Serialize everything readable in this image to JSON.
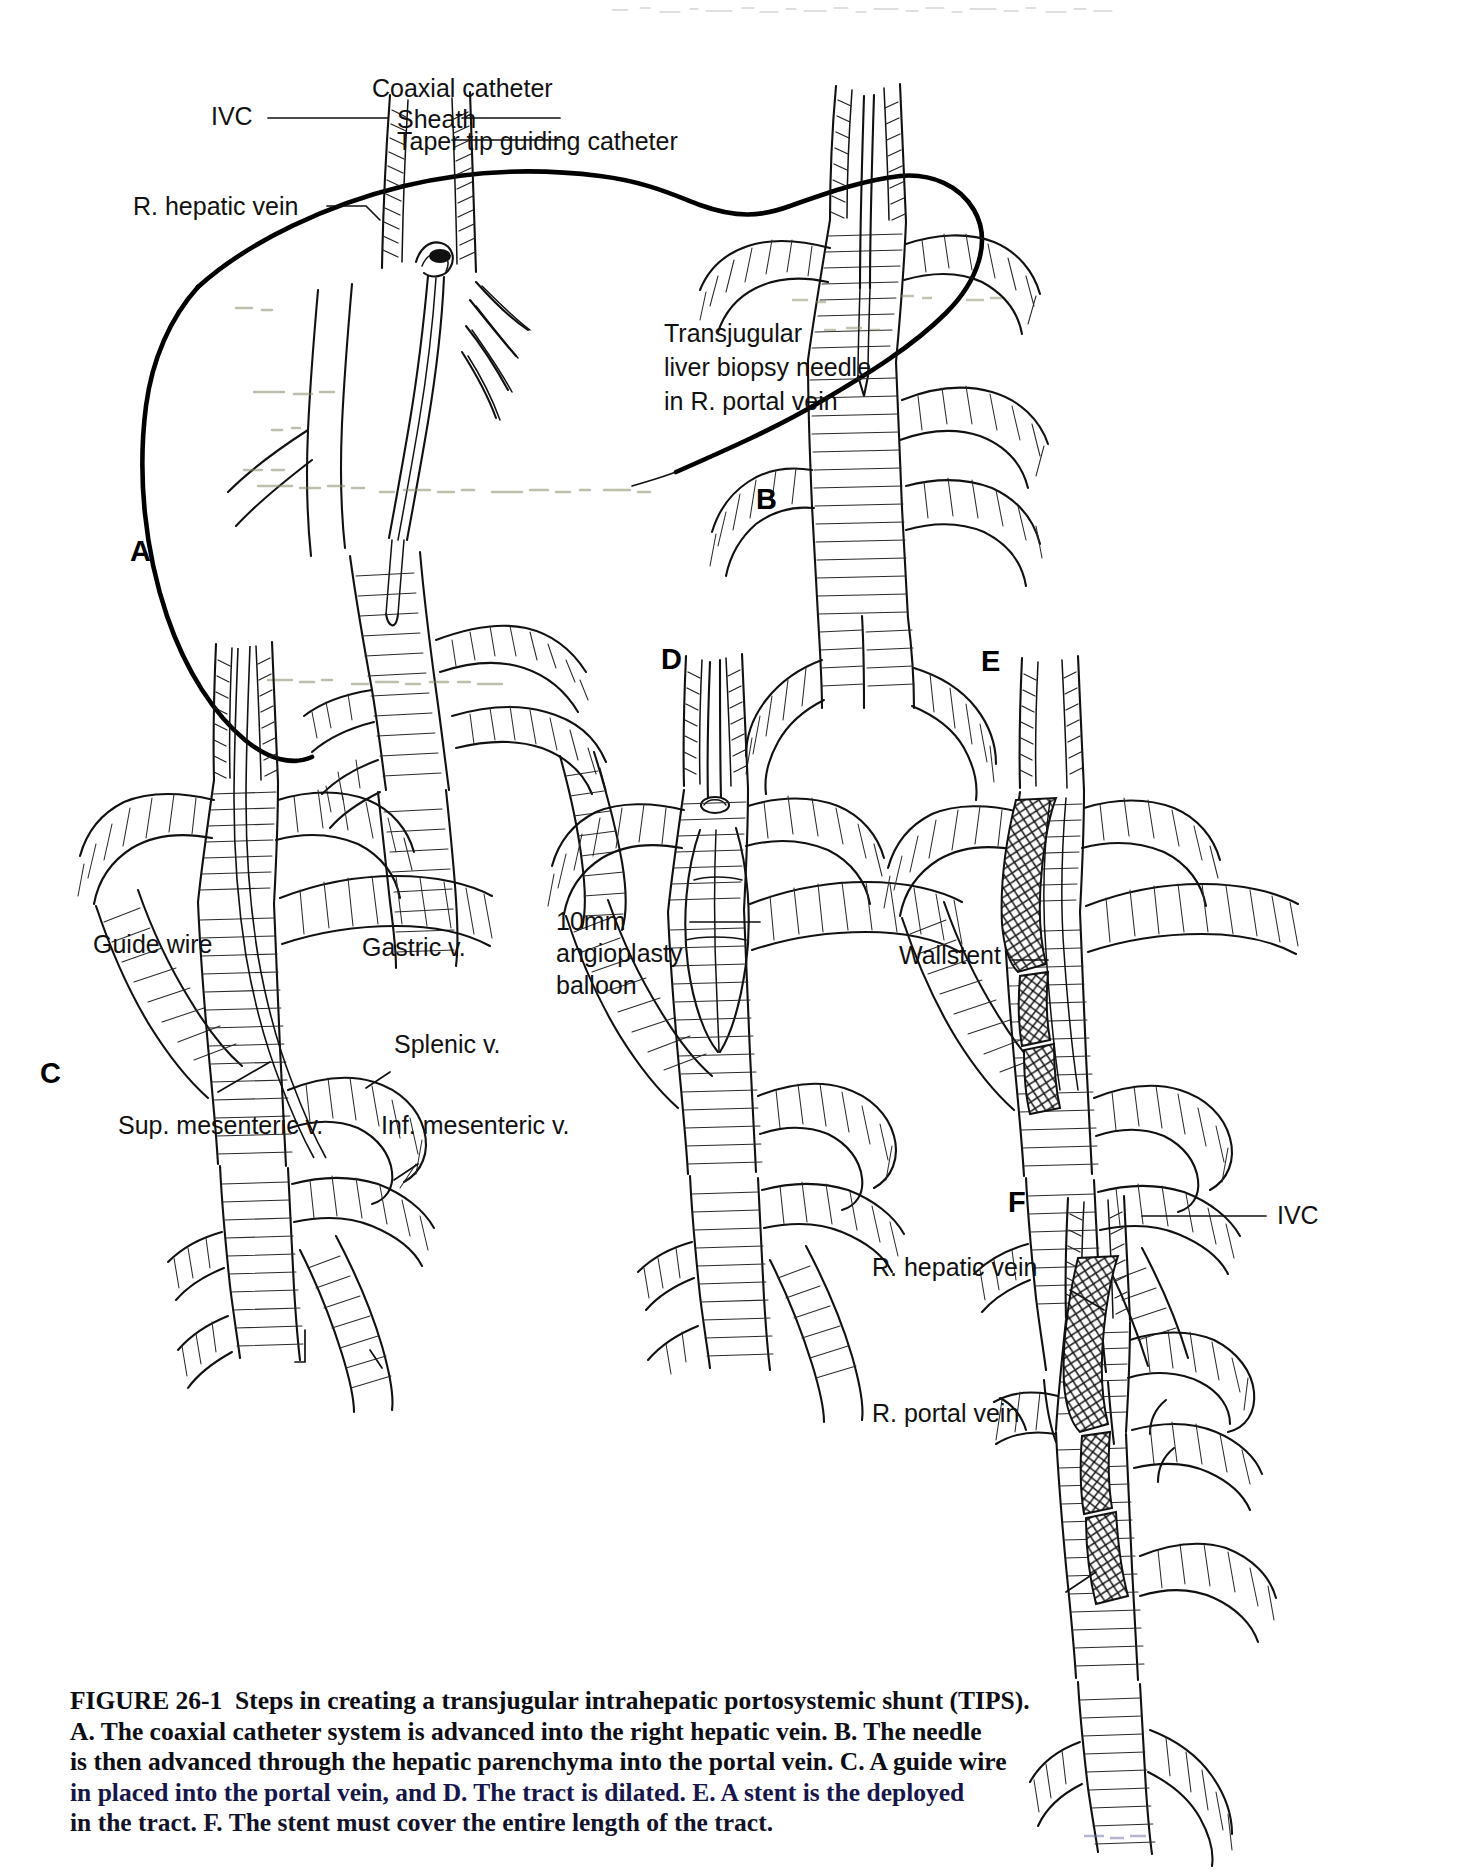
{
  "figure": {
    "id": "FIGURE 26-1",
    "caption_lines": [
      "FIGURE 26-1  Steps in creating a transjugular intrahepatic portosystemic shunt (TIPS).",
      "A. The coaxial catheter system is advanced into the right hepatic vein. B. The needle",
      "is then advanced through the hepatic parenchyma into the portal vein. C. A guide wire",
      "in placed into the portal vein, and D. The tract is dilated. E. A stent is the deployed",
      "in the tract. F. The stent must cover the entire length of the tract."
    ]
  },
  "panels": {
    "a": {
      "letter": "A",
      "labels": {
        "ivc": "IVC",
        "coaxial_catheter": "Coaxial catheter",
        "sheath": "Sheath",
        "taper_tip": "Taper tip guiding catheter",
        "right_hepatic_vein": "R. hepatic vein"
      }
    },
    "b": {
      "letter": "B",
      "labels": {
        "needle_line1": "Transjugular",
        "needle_line2": "liver biopsy needle",
        "needle_line3": "in R. portal vein"
      }
    },
    "c": {
      "letter": "C",
      "labels": {
        "guide_wire": "Guide wire",
        "gastric_vein": "Gastric v.",
        "splenic_vein": "Splenic v.",
        "sup_mesenteric_vein": "Sup. mesenteric v.",
        "inf_mesenteric_vein": "Inf. mesenteric v."
      }
    },
    "d": {
      "letter": "D",
      "labels": {
        "balloon_line1": "10mm",
        "balloon_line2": "angioplasty",
        "balloon_line3": "balloon"
      }
    },
    "e": {
      "letter": "E",
      "labels": {
        "wallstent": "Wallstent"
      }
    },
    "f": {
      "letter": "F",
      "labels": {
        "ivc": "IVC",
        "right_hepatic_vein": "R. hepatic vein",
        "right_portal_vein": "R. portal vein"
      }
    }
  },
  "colors": {
    "ink": "#111111",
    "paper": "#ffffff"
  }
}
